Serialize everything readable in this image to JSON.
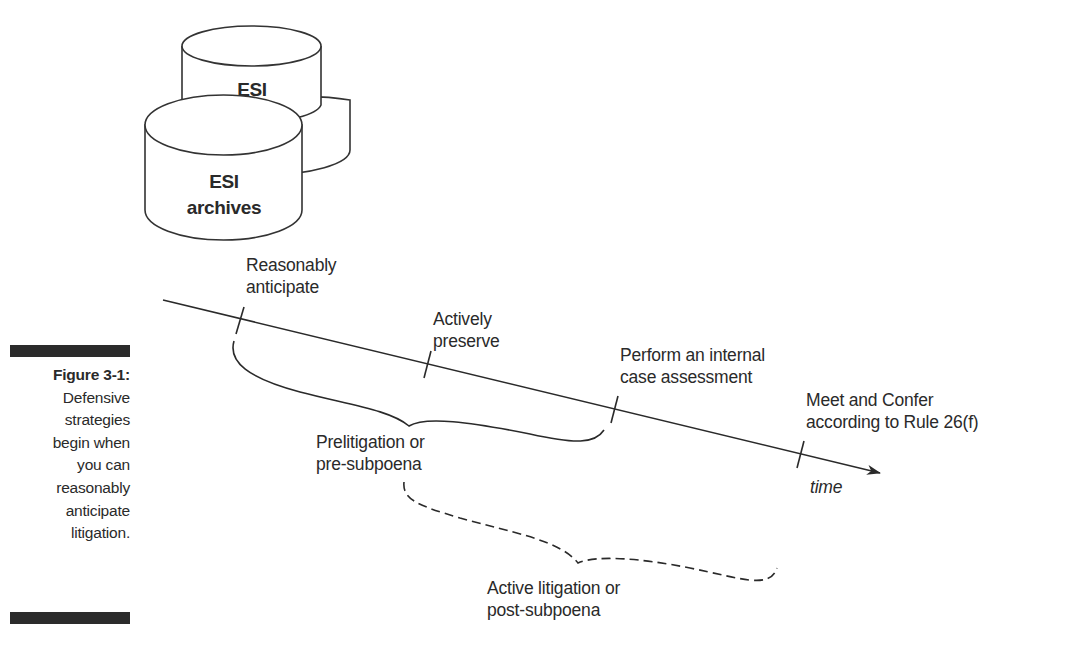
{
  "caption": {
    "figure_label": "Figure 3-1:",
    "lines": [
      "Defensive",
      "strategies",
      "begin when",
      "you can",
      "reasonably",
      "anticipate",
      "litigation."
    ]
  },
  "storage": {
    "back_cylinder_label": "ESI",
    "front_cylinder_label_line1": "ESI",
    "front_cylinder_label_line2": "archives"
  },
  "timeline": {
    "axis_label": "time",
    "milestones": [
      {
        "line1": "Reasonably",
        "line2": "anticipate"
      },
      {
        "line1": "Actively",
        "line2": "preserve"
      },
      {
        "line1": "Perform an internal",
        "line2": "case assessment"
      },
      {
        "line1": "Meet and Confer",
        "line2": "according to Rule 26(f)"
      }
    ]
  },
  "phases": [
    {
      "line1": "Prelitigation or",
      "line2": "pre-subpoena",
      "style": "solid"
    },
    {
      "line1": "Active litigation or",
      "line2": "post-subpoena",
      "style": "dashed"
    }
  ],
  "colors": {
    "ink": "#2a2a2a",
    "bar": "#2b2b2b",
    "background": "#ffffff"
  }
}
